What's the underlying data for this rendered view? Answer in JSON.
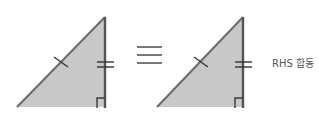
{
  "diagram": {
    "left_triangle": {
      "fill_color": "#c8c8c8",
      "hypotenuse_marks": 1,
      "leg_marks": 2,
      "right_angle": true
    },
    "relation_symbol": "≡",
    "right_triangle": {
      "fill_color": "#c8c8c8",
      "hypotenuse_marks": 1,
      "leg_marks": 2,
      "right_angle": true
    },
    "label": "RHS 합동"
  }
}
